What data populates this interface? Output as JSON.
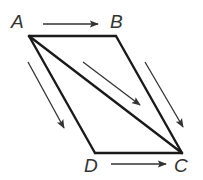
{
  "diagram": {
    "colors": {
      "stroke": "#1a1a1a",
      "arrow": "#333333",
      "label": "#333333",
      "background": "#ffffff"
    },
    "vertices": [
      {
        "id": "A",
        "label": "A",
        "x": 29,
        "y": 36,
        "lx": 11,
        "ly": 28
      },
      {
        "id": "B",
        "label": "B",
        "x": 116,
        "y": 36,
        "lx": 110,
        "ly": 28
      },
      {
        "id": "C",
        "label": "C",
        "x": 182,
        "y": 153,
        "lx": 174,
        "ly": 172
      },
      {
        "id": "D",
        "label": "D",
        "x": 95,
        "y": 153,
        "lx": 84,
        "ly": 172
      }
    ],
    "edges": [
      {
        "from": "A",
        "to": "B"
      },
      {
        "from": "B",
        "to": "C"
      },
      {
        "from": "C",
        "to": "D"
      },
      {
        "from": "D",
        "to": "A"
      },
      {
        "from": "A",
        "to": "C"
      }
    ],
    "arrows": [
      {
        "name": "arrow-ab",
        "x1": 43,
        "y1": 24,
        "x2": 98,
        "y2": 24
      },
      {
        "name": "arrow-dc",
        "x1": 111,
        "y1": 164,
        "x2": 166,
        "y2": 164
      },
      {
        "name": "arrow-ad",
        "x1": 28,
        "y1": 62,
        "x2": 64,
        "y2": 128
      },
      {
        "name": "arrow-ac",
        "x1": 83,
        "y1": 62,
        "x2": 140,
        "y2": 105
      },
      {
        "name": "arrow-bc",
        "x1": 145,
        "y1": 62,
        "x2": 183,
        "y2": 127
      }
    ]
  }
}
